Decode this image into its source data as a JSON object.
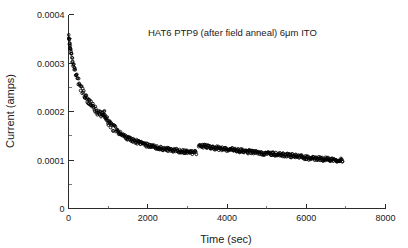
{
  "chart_data": {
    "type": "scatter",
    "title": "",
    "annotation": "HAT6 PTP9 (after field anneal) 6μm ITO",
    "xlabel": "Time (sec)",
    "ylabel": "Current (amps)",
    "xlim": [
      0,
      8000
    ],
    "ylim": [
      0,
      0.0004
    ],
    "xticks": [
      0,
      2000,
      4000,
      6000,
      8000
    ],
    "xtick_labels": [
      "0",
      "2000",
      "4000",
      "6000",
      "8000"
    ],
    "yticks": [
      0,
      0.0001,
      0.0002,
      0.0003,
      0.0004
    ],
    "ytick_labels": [
      "0",
      "0.0001",
      "0.0002",
      "0.0003",
      "0.0004"
    ],
    "grid": false,
    "legend": null,
    "marker_style": "open-circle",
    "marker_color": "#000000",
    "series": [
      {
        "name": "segment-1",
        "x": [
          5,
          12,
          20,
          28,
          36,
          45,
          55,
          65,
          78,
          92,
          108,
          125,
          142,
          160,
          180,
          200,
          222,
          245,
          268,
          292,
          318,
          345,
          372,
          400,
          430,
          460,
          492,
          525,
          558,
          592,
          628,
          665,
          702,
          740,
          780,
          820,
          862,
          880,
          900,
          915,
          930,
          948,
          965,
          985,
          1005,
          1030,
          1060,
          1095,
          1130,
          1170,
          1210,
          1255,
          1300,
          1348,
          1398,
          1450,
          1505,
          1562,
          1620,
          1682,
          1745,
          1812,
          1880,
          1950,
          2022,
          2098,
          2175,
          2255,
          2338,
          2422,
          2510,
          2600,
          2692,
          2788,
          2885,
          2985,
          3088,
          3150,
          3200,
          3240
        ],
        "y": [
          0.000362,
          0.000355,
          0.000348,
          0.000341,
          0.000335,
          0.000329,
          0.000323,
          0.000318,
          0.000312,
          0.000306,
          0.0003,
          0.000294,
          0.000289,
          0.000284,
          0.000278,
          0.000273,
          0.000268,
          0.000263,
          0.000258,
          0.000253,
          0.000248,
          0.000244,
          0.000239,
          0.000235,
          0.000231,
          0.000227,
          0.000223,
          0.000219,
          0.000215,
          0.000212,
          0.000208,
          0.000205,
          0.000202,
          0.000199,
          0.000196,
          0.000194,
          0.000192,
          0.000196,
          0.000199,
          0.000194,
          0.000188,
          0.000185,
          0.000183,
          0.000181,
          0.000179,
          0.000176,
          0.000173,
          0.00017,
          0.000167,
          0.000164,
          0.000161,
          0.000158,
          0.000155,
          0.000152,
          0.00015,
          0.000147,
          0.000145,
          0.000143,
          0.000141,
          0.000139,
          0.000137,
          0.000135,
          0.000133,
          0.000131,
          0.00013,
          0.000128,
          0.000127,
          0.000125,
          0.000124,
          0.000123,
          0.000122,
          0.000121,
          0.00012,
          0.000119,
          0.000118,
          0.000117,
          0.000116,
          0.000115,
          0.000115,
          0.000114
        ]
      },
      {
        "name": "segment-2",
        "x": [
          3285,
          3320,
          3360,
          3400,
          3445,
          3490,
          3535,
          3580,
          3625,
          3672,
          3720,
          3768,
          3818,
          3868,
          3918,
          3970,
          4022,
          4075,
          4128,
          4182,
          4238,
          4292,
          4348,
          4405,
          4462,
          4520,
          4578,
          4638,
          4698,
          4758,
          4820,
          4882,
          4945,
          5008,
          5072,
          5138,
          5202,
          5268,
          5335,
          5402,
          5470,
          5538,
          5608,
          5678,
          5748,
          5820,
          5892,
          5965,
          6038,
          6112,
          6188,
          6262,
          6338,
          6415,
          6492,
          6570,
          6648,
          6728,
          6808,
          6888,
          6930
        ],
        "y": [
          0.000131,
          0.00013,
          0.000129,
          0.000129,
          0.000128,
          0.000128,
          0.000127,
          0.000127,
          0.000126,
          0.000125,
          0.000125,
          0.000124,
          0.000124,
          0.000123,
          0.000123,
          0.000122,
          0.000122,
          0.000121,
          0.000121,
          0.00012,
          0.00012,
          0.000119,
          0.000119,
          0.000118,
          0.000118,
          0.000117,
          0.000117,
          0.000116,
          0.000116,
          0.000115,
          0.000115,
          0.000114,
          0.000114,
          0.000113,
          0.000113,
          0.000112,
          0.000112,
          0.000112,
          0.000111,
          0.000111,
          0.00011,
          0.00011,
          0.000109,
          0.000109,
          0.000108,
          0.000107,
          0.000106,
          0.000105,
          0.000104,
          0.000103,
          0.000103,
          0.000103,
          0.000103,
          0.000102,
          0.000102,
          0.000102,
          0.000101,
          0.000101,
          0.0001,
          0.0001,
          9.9e-05
        ]
      }
    ]
  },
  "axes": {
    "x_axis_name": "Time (sec)",
    "y_axis_name": "Current (amps)"
  }
}
